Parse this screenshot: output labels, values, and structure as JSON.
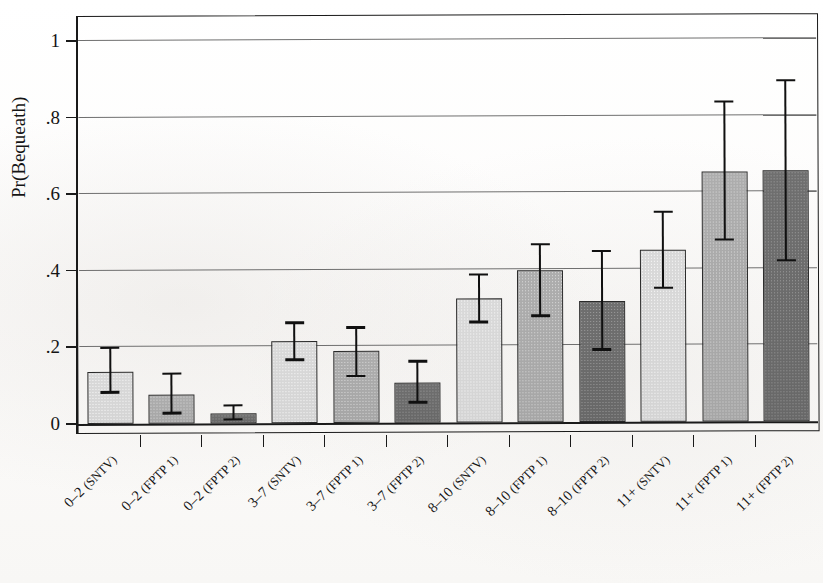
{
  "chart_data": {
    "type": "bar",
    "title": "",
    "xlabel": "",
    "ylabel": "Pr(Bequeath)",
    "ylim": [
      0,
      1.06
    ],
    "ytick_values": [
      0,
      0.2,
      0.4,
      0.6,
      0.8,
      1
    ],
    "ytick_labels": [
      "0",
      ".2",
      ".4",
      ".6",
      ".8",
      "1"
    ],
    "grid": "horizontal",
    "legend": "none",
    "error_bars": "95% confidence interval",
    "categories": [
      "0–2 (SNTV)",
      "0–2 (FPTP 1)",
      "0–2 (FPTP 2)",
      "3–7 (SNTV)",
      "3–7 (FPTP 1)",
      "3–7 (FPTP 2)",
      "8–10 (SNTV)",
      "8–10 (FPTP 1)",
      "8–10 (FPTP 2)",
      "11+ (SNTV)",
      "11+ (FPTP 1)",
      "11+ (FPTP 2)"
    ],
    "values": [
      0.137,
      0.075,
      0.026,
      0.214,
      0.189,
      0.105,
      0.324,
      0.398,
      0.317,
      0.449,
      0.653,
      0.655
    ],
    "ci_lower": [
      0.082,
      0.028,
      0.01,
      0.166,
      0.123,
      0.054,
      0.263,
      0.278,
      0.19,
      0.35,
      0.475,
      0.42
    ],
    "ci_upper": [
      0.199,
      0.131,
      0.047,
      0.262,
      0.249,
      0.16,
      0.386,
      0.465,
      0.447,
      0.548,
      0.835,
      0.89
    ],
    "shades": [
      "light",
      "mid",
      "dark",
      "light",
      "mid",
      "dark",
      "light",
      "mid",
      "dark",
      "light",
      "mid",
      "dark"
    ],
    "shade_colors": {
      "light": "#d9d9d9",
      "mid": "#adadad",
      "dark": "#6f6f6f",
      "outline": "#2a2a2a",
      "error_bar": "#101010",
      "axis": "#1a1a1a",
      "grid": "#6f6f6f"
    },
    "group_labels": [
      "0–2",
      "3–7",
      "8–10",
      "11+"
    ],
    "series_labels": [
      "SNTV",
      "FPTP 1",
      "FPTP 2"
    ]
  }
}
